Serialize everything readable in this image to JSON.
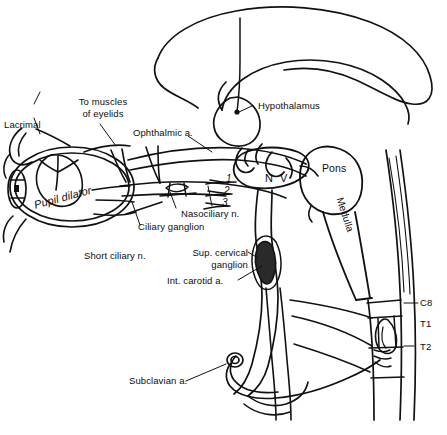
{
  "figure": {
    "background_color": "#ffffff",
    "ink_color": "#111111",
    "width": 447,
    "height": 435
  },
  "labels": {
    "lacrimal": "Lacrimal",
    "to_muscles_of_eyelids_line1": "To muscles",
    "to_muscles_of_eyelids_line2": "of eyelids",
    "ophthalmic_artery": "Ophthalmic a.",
    "hypothalamus": "Hypothalamus",
    "pupil_dilator": "Pupil dilator",
    "nasociliary_nerve": "Nasociliary n.",
    "ciliary_ganglion": "Ciliary ganglion",
    "short_ciliary_nerve": "Short ciliary n.",
    "sup_cervical_ganglion_line1": "Sup. cervical",
    "sup_cervical_ganglion_line2": "ganglion",
    "int_carotid_artery": "Int. carotid a.",
    "subclavian_artery": "Subclavian a.",
    "pons": "Pons",
    "medulla": "Medulla",
    "trigeminal_nerve": "N V",
    "trigeminal_branch_1": "1",
    "trigeminal_branch_2": "2",
    "trigeminal_branch_3": "3",
    "spinal_level_c8": "C8",
    "spinal_level_t1": "T1",
    "spinal_level_t2": "T2"
  }
}
